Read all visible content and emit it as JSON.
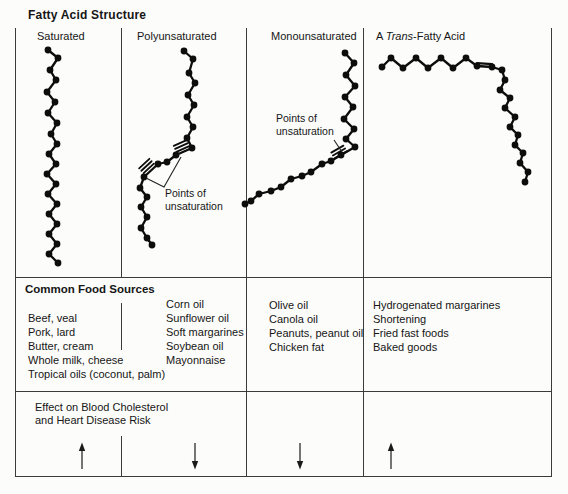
{
  "title": "Fatty Acid Structure",
  "structure": {
    "columns": [
      {
        "id": "saturated",
        "header": "Saturated"
      },
      {
        "id": "polyunsaturated",
        "header": "Polyunsaturated"
      },
      {
        "id": "monounsaturated",
        "header": "Monounsaturated"
      },
      {
        "id": "trans",
        "header_parts": {
          "prefix": "A ",
          "italic": "Trans",
          "suffix": "-Fatty Acid"
        }
      }
    ]
  },
  "annotations": {
    "poly": {
      "lines": [
        "Points of",
        "unsaturation"
      ],
      "pointer": [
        [
          181,
          157
        ],
        [
          164,
          187
        ],
        [
          146,
          178
        ]
      ]
    },
    "mono": {
      "lines": [
        "Points of",
        "unsaturation"
      ],
      "pointer": [
        [
          334,
          140
        ],
        [
          342,
          152
        ]
      ]
    }
  },
  "chains": {
    "saturated": {
      "points": [
        [
          48,
          50
        ],
        [
          58,
          58
        ],
        [
          50,
          70
        ],
        [
          56,
          80
        ],
        [
          47,
          92
        ],
        [
          55,
          102
        ],
        [
          48,
          113
        ],
        [
          57,
          123
        ],
        [
          51,
          134
        ],
        [
          57,
          144
        ],
        [
          49,
          154
        ],
        [
          56,
          164
        ],
        [
          47,
          174
        ],
        [
          56,
          184
        ],
        [
          48,
          194
        ],
        [
          57,
          204
        ],
        [
          49,
          214
        ],
        [
          57,
          224
        ],
        [
          49,
          234
        ],
        [
          57,
          244
        ],
        [
          49,
          254
        ],
        [
          58,
          263
        ]
      ],
      "double_bonds": []
    },
    "polyunsaturated": {
      "points": [
        [
          184,
          51
        ],
        [
          193,
          59
        ],
        [
          189,
          73
        ],
        [
          195,
          83
        ],
        [
          188,
          95
        ],
        [
          194,
          105
        ],
        [
          187,
          117
        ],
        [
          193,
          127
        ],
        [
          187,
          138
        ],
        [
          192,
          148
        ],
        [
          176,
          155
        ],
        [
          167,
          162
        ],
        [
          158,
          164
        ],
        [
          144,
          177
        ],
        [
          140,
          188
        ],
        [
          147,
          197
        ],
        [
          141,
          207
        ],
        [
          147,
          217
        ],
        [
          141,
          228
        ],
        [
          147,
          238
        ],
        [
          152,
          245
        ]
      ],
      "double_bonds": [
        {
          "type": "hash",
          "hash_center": [
            181.5,
            146
          ],
          "angle": 156
        },
        {
          "type": "hash",
          "hash_center": [
            146.5,
            166
          ],
          "angle": 137
        }
      ]
    },
    "monounsaturated": {
      "points": [
        [
          345,
          53
        ],
        [
          354,
          63
        ],
        [
          346,
          75
        ],
        [
          355,
          86
        ],
        [
          345,
          97
        ],
        [
          353,
          107
        ],
        [
          344,
          119
        ],
        [
          354,
          129
        ],
        [
          346,
          139
        ],
        [
          355,
          147
        ],
        [
          341,
          155
        ],
        [
          331,
          161
        ],
        [
          322,
          164
        ],
        [
          311,
          172
        ],
        [
          302,
          176
        ],
        [
          291,
          179
        ],
        [
          281,
          187
        ],
        [
          271,
          191
        ],
        [
          259,
          194
        ],
        [
          251,
          201
        ],
        [
          245,
          204
        ]
      ],
      "double_bonds": [
        {
          "type": "hash",
          "hash_center": [
            339,
            152
          ],
          "angle": 150
        }
      ]
    },
    "trans": {
      "points": [
        [
          382,
          67
        ],
        [
          391,
          58
        ],
        [
          403,
          68
        ],
        [
          416,
          58
        ],
        [
          428,
          68
        ],
        [
          441,
          58
        ],
        [
          453,
          68
        ],
        [
          466,
          58
        ],
        [
          477,
          66
        ],
        [
          492,
          67
        ],
        [
          502,
          70
        ],
        [
          505,
          80
        ],
        [
          500,
          90
        ],
        [
          510,
          98
        ],
        [
          505,
          108
        ],
        [
          515,
          117
        ],
        [
          510,
          127
        ],
        [
          518,
          135
        ],
        [
          515,
          145
        ],
        [
          523,
          153
        ],
        [
          520,
          163
        ],
        [
          528,
          172
        ],
        [
          525,
          182
        ]
      ],
      "double_bonds": [
        {
          "type": "parallel",
          "from": [
            477,
            63.2
          ],
          "to": [
            492,
            64.2
          ]
        }
      ]
    }
  },
  "food_sources": {
    "heading": "Common Food Sources",
    "columns": [
      {
        "items": [
          "Beef, veal",
          "Pork, lard",
          "Butter, cream",
          "Whole milk, cheese",
          "Tropical oils (coconut, palm)"
        ]
      },
      {
        "items": [
          "Corn oil",
          "Sunflower oil",
          "Soft margarines",
          "Soybean oil",
          "Mayonnaise"
        ]
      },
      {
        "items": [
          "Olive oil",
          "Canola oil",
          "Peanuts, peanut oil",
          "Chicken fat"
        ]
      },
      {
        "items": [
          "Hydrogenated margarines",
          "Shortening",
          "Fried fast foods",
          "Baked goods"
        ]
      }
    ]
  },
  "effect": {
    "label_lines": [
      "Effect on Blood Cholesterol",
      "and Heart Disease Risk"
    ],
    "arrows": [
      {
        "column": "Saturated",
        "direction": "up"
      },
      {
        "column": "Polyunsaturated",
        "direction": "down"
      },
      {
        "column": "Monounsaturated",
        "direction": "down"
      },
      {
        "column": "A Trans-Fatty Acid",
        "direction": "up"
      }
    ]
  },
  "colors": {
    "ink": "#0d0d0d",
    "grid": "#3b3b3b",
    "background": "#fcfcfa"
  }
}
